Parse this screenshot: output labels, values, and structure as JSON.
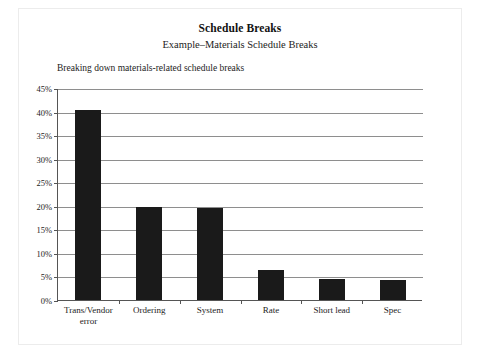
{
  "page": {
    "title": "Schedule Breaks",
    "subtitle": "Example–Materials Schedule Breaks",
    "caption": "Breaking down materials-related schedule breaks"
  },
  "style": {
    "bar_color": "#1a1a1a",
    "gridline_color": "#8e8e8e",
    "axis_color": "#555555",
    "page_background": "#ffffff"
  },
  "chart_data": {
    "type": "bar",
    "title": "Schedule Breaks",
    "subtitle": "Example–Materials Schedule Breaks",
    "annotation": "Breaking down materials-related schedule breaks",
    "xlabel": "",
    "ylabel": "",
    "categories": [
      "Trans/Vendor\nerror",
      "Ordering",
      "System",
      "Rate",
      "Short lead",
      "Spec"
    ],
    "values": [
      40.3,
      19.7,
      19.6,
      6.3,
      4.5,
      4.3
    ],
    "ylim": [
      0,
      45
    ],
    "ytick_values": [
      0,
      5,
      10,
      15,
      20,
      25,
      30,
      35,
      40,
      45
    ],
    "ytick_labels": [
      "0%",
      "5%",
      "10%",
      "15%",
      "20%",
      "25%",
      "30%",
      "35%",
      "40%",
      "45%"
    ],
    "grid": true,
    "legend": false,
    "legend_position": "none"
  }
}
